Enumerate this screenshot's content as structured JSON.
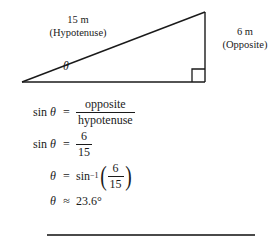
{
  "diagram": {
    "name": "right-triangle-trigonometry-diagram",
    "hypotenuse_length": "15 m",
    "hypotenuse_role": "(Hypotenuse)",
    "opposite_length": "6 m",
    "opposite_role": "(Opposite)",
    "angle_symbol": "θ",
    "right_angle_marker": "square",
    "stroke_color": "#1a1a1a",
    "vertices": {
      "left": [
        22,
        82
      ],
      "apex": [
        205,
        12
      ],
      "right": [
        205,
        82
      ]
    }
  },
  "equations": {
    "sin_definition": {
      "lhs_fn": "sin",
      "lhs_var": "θ",
      "equals": "=",
      "numerator": "opposite",
      "denominator": "hypotenuse"
    },
    "sin_value": {
      "lhs_fn": "sin",
      "lhs_var": "θ",
      "equals": "=",
      "numerator": "6",
      "denominator": "15"
    },
    "inverse": {
      "lhs_var": "θ",
      "equals": "=",
      "fn": "sin",
      "exponent": "−1",
      "open_paren": "(",
      "numerator": "6",
      "denominator": "15",
      "close_paren": ")"
    },
    "result": {
      "lhs_var": "θ",
      "approx": "≈",
      "value": "23.6°"
    }
  },
  "divider": {
    "color": "#4a4a4a"
  }
}
